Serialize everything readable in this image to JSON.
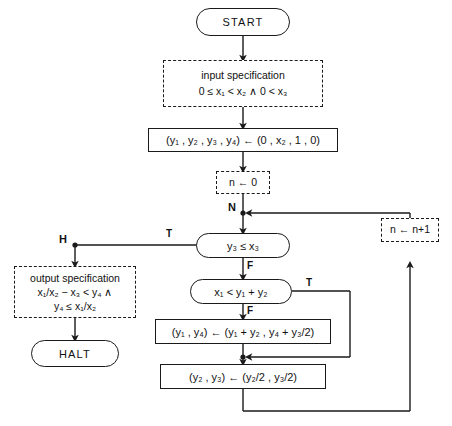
{
  "diagram": {
    "stroke_color": "#1a1a1a",
    "background": "#ffffff"
  },
  "nodes": {
    "start": {
      "label": "START",
      "shape": "terminal"
    },
    "input_spec": {
      "title": "input specification",
      "formula": "0 ≤ x₁ < x₂ ∧ 0 < x₃",
      "shape": "dashed-box"
    },
    "init_assign": {
      "formula": "(y₁ , y₂ , y₃ , y₄) ← (0 , x₂ , 1 , 0)",
      "shape": "process"
    },
    "counter_init": {
      "formula": "n ← 0",
      "shape": "dashed-box"
    },
    "decision_outer": {
      "formula": "y₃ ≤ x₃",
      "shape": "decision",
      "true_label": "T",
      "false_label": "F"
    },
    "decision_inner": {
      "formula": "x₁ < y₁ + y₂",
      "shape": "decision",
      "true_label": "T",
      "false_label": "F"
    },
    "assign_y1_y4": {
      "formula": "(y₁ , y₄) ← (y₁ + y₂ , y₄ + y₃/2)",
      "shape": "process"
    },
    "assign_y2_y3": {
      "formula": "(y₂ , y₃) ← (y₂/2 , y₃/2)",
      "shape": "process"
    },
    "counter_incr": {
      "formula": "n ← n+1",
      "shape": "dashed-box"
    },
    "output_spec": {
      "title": "output specification",
      "formula_line1": "x₁/x₂ − x₃ < y₄ ∧",
      "formula_line2": "y₄ ≤ x₁/x₂",
      "shape": "dashed-box"
    },
    "halt": {
      "label": "HALT",
      "shape": "terminal"
    }
  },
  "annotations": {
    "loop_invariant_point": "N",
    "halt_point": "H",
    "outer_true": "T",
    "outer_false": "F",
    "inner_true": "T",
    "inner_false": "F"
  }
}
